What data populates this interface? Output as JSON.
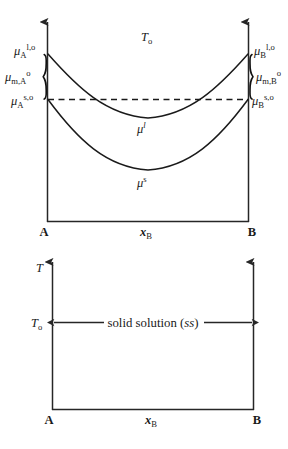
{
  "figure": {
    "title_visible": false,
    "panels": [
      {
        "id": "chemical-potential-panel",
        "y_axis_quantity": "μ",
        "temperature_label": {
          "base": "T",
          "sub": "o"
        },
        "left_endpoint": "A",
        "right_endpoint": "B",
        "x_axis_label": {
          "base": "x",
          "sub": "B"
        },
        "curves": [
          {
            "name": "liquid-free-energy-curve",
            "label_base": "μ",
            "label_sup": "l",
            "label_sup_italic": true,
            "endpoints": [
              "μ_A^{l,o}",
              "μ_B^{l,o}"
            ]
          },
          {
            "name": "solid-free-energy-curve",
            "label_base": "μ",
            "label_sup": "s",
            "label_sup_italic": false,
            "endpoints": [
              "μ_A^{s,o}",
              "μ_B^{s,o}"
            ]
          }
        ],
        "left_labels": [
          {
            "name": "mu-A-liquid-standard",
            "base": "μ",
            "sub": "A",
            "sup": "l,o",
            "sup_italic_first": true
          },
          {
            "name": "mu-melt-A",
            "base": "μ",
            "sub": "m,A",
            "sup": "o",
            "sup_italic_first": false
          },
          {
            "name": "mu-A-solid-standard",
            "base": "μ",
            "sub": "A",
            "sup": "s,o",
            "sup_italic_first": false
          }
        ],
        "right_labels": [
          {
            "name": "mu-B-liquid-standard",
            "base": "μ",
            "sub": "B",
            "sup": "l,o",
            "sup_italic_first": true
          },
          {
            "name": "mu-melt-B",
            "base": "μ",
            "sub": "m,B",
            "sup": "o",
            "sup_italic_first": false
          },
          {
            "name": "mu-B-solid-standard",
            "base": "μ",
            "sub": "B",
            "sup": "s,o",
            "sup_italic_first": false
          }
        ],
        "dashed_reference_line": true
      },
      {
        "id": "phase-diagram-panel",
        "y_axis_label": "T",
        "temperature_tick": {
          "base": "T",
          "sub": "o"
        },
        "phase_region_label": {
          "text": "solid solution (",
          "italic_part": "ss",
          "text_end": ")"
        },
        "left_endpoint": "A",
        "right_endpoint": "B",
        "x_axis_label": {
          "base": "x",
          "sub": "B"
        },
        "span_arrow": "double-headed"
      }
    ]
  }
}
